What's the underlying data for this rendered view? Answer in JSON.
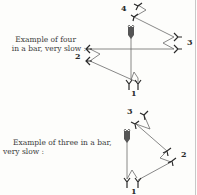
{
  "figure_top": {
    "caption_line1": "Example of four",
    "caption_line2": "in a bar, very slow :",
    "beats": [
      {
        "label": "1"
      },
      {
        "label": "2"
      },
      {
        "label": "3"
      },
      {
        "label": "4"
      }
    ]
  },
  "figure_bottom": {
    "caption_line1": "Example of three in a bar,",
    "caption_line2": "very slow :",
    "beats": [
      {
        "label": "1"
      },
      {
        "label": "2"
      },
      {
        "label": "3"
      }
    ]
  },
  "colors": {
    "ink": "#333333",
    "line": "#6a6a6a",
    "paper": "#fdfdfb"
  }
}
